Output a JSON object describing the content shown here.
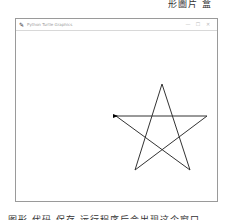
{
  "page": {
    "top_text": "形圖片 盒",
    "bottom_text": "图形  代码  保存  运行程序后会出现这个窗口"
  },
  "window": {
    "title": "Python Turtle Graphics",
    "controls": {
      "minimize": "—",
      "maximize": "☐",
      "close": "✕"
    }
  },
  "drawing": {
    "shape": "five-pointed star",
    "stroke_color": "#333333",
    "vertices": [
      [
        162,
        84
      ],
      [
        190,
        170
      ],
      [
        116,
        116
      ],
      [
        207,
        116
      ],
      [
        135,
        170
      ]
    ],
    "turtle_position": [
      116,
      116
    ]
  }
}
